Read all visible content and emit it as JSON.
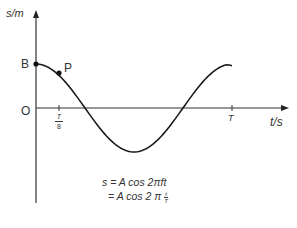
{
  "diagram": {
    "type": "displacement-time graph (cosine)",
    "y_axis_label": "s/m",
    "x_axis_label": "t/s",
    "origin_label": "O",
    "points": [
      {
        "label": "B",
        "description": "start point at maximum displacement"
      },
      {
        "label": "P",
        "description": "point on curve at t = T/8"
      }
    ],
    "x_ticks": [
      {
        "num": "T",
        "den": "8"
      },
      {
        "label": "T"
      }
    ],
    "equation": {
      "line1": "s = A cos 2πft",
      "line2_prefix": "= A cos 2 π",
      "line2_frac_num": "t",
      "line2_frac_den": "T"
    },
    "colors": {
      "curve": "#1a1a1a",
      "axis": "#333333",
      "background": "#ffffff"
    }
  }
}
